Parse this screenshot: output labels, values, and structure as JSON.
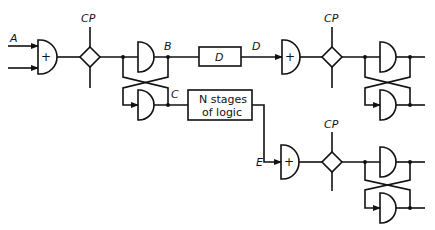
{
  "diagram": {
    "labels": {
      "input_a": "A",
      "node_b": "B",
      "node_c": "C",
      "node_d": "D",
      "node_e": "E",
      "clock_1": "CP",
      "clock_2": "CP",
      "clock_3": "CP"
    },
    "gates": {
      "or_symbol": "+"
    },
    "blocks": {
      "delay": "D",
      "logic_line1": "N stages",
      "logic_line2": "of logic"
    }
  }
}
